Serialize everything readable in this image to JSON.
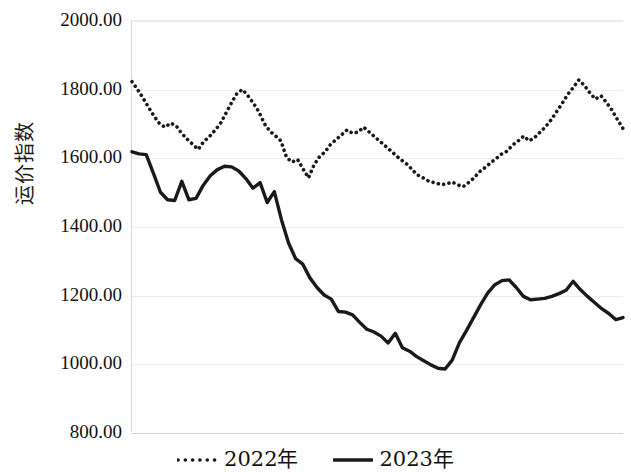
{
  "chart_data": {
    "type": "line",
    "title": "",
    "xlabel": "",
    "ylabel": "运价指数",
    "ylim": [
      800,
      2000
    ],
    "ytick_labels": [
      "2000.00",
      "1800.00",
      "1600.00",
      "1400.00",
      "1200.00",
      "1000.00",
      "800.00"
    ],
    "ytick_values": [
      2000,
      1800,
      1600,
      1400,
      1200,
      1000,
      800
    ],
    "grid": true,
    "xtick_labels": [],
    "legend_position": "bottom-center",
    "series": [
      {
        "name": "2022年",
        "style": "dotted",
        "color": "#1a1a1a",
        "values": [
          1823,
          1800,
          1775,
          1748,
          1722,
          1700,
          1690,
          1702,
          1694,
          1672,
          1655,
          1640,
          1625,
          1648,
          1662,
          1680,
          1700,
          1730,
          1760,
          1788,
          1800,
          1782,
          1760,
          1735,
          1700,
          1678,
          1665,
          1650,
          1602,
          1588,
          1596,
          1568,
          1542,
          1580,
          1604,
          1618,
          1640,
          1654,
          1668,
          1682,
          1672,
          1676,
          1690,
          1676,
          1662,
          1648,
          1634,
          1620,
          1605,
          1592,
          1580,
          1562,
          1548,
          1540,
          1530,
          1528,
          1522,
          1524,
          1530,
          1522,
          1516,
          1528,
          1542,
          1560,
          1572,
          1586,
          1598,
          1612,
          1620,
          1638,
          1650,
          1664,
          1650,
          1660,
          1676,
          1692,
          1712,
          1736,
          1760,
          1786,
          1806,
          1828,
          1812,
          1790,
          1772,
          1782,
          1762,
          1740,
          1712,
          1686
        ]
      },
      {
        "name": "2023年",
        "style": "solid",
        "color": "#1a1a1a",
        "values": [
          1618,
          1612,
          1610,
          1556,
          1500,
          1478,
          1476,
          1532,
          1478,
          1482,
          1520,
          1548,
          1566,
          1576,
          1574,
          1562,
          1540,
          1512,
          1528,
          1470,
          1502,
          1420,
          1352,
          1306,
          1290,
          1250,
          1222,
          1200,
          1188,
          1152,
          1150,
          1142,
          1120,
          1100,
          1092,
          1080,
          1060,
          1088,
          1046,
          1036,
          1020,
          1008,
          996,
          986,
          984,
          1010,
          1060,
          1096,
          1134,
          1172,
          1206,
          1230,
          1242,
          1244,
          1222,
          1196,
          1186,
          1188,
          1190,
          1196,
          1204,
          1214,
          1240,
          1216,
          1196,
          1178,
          1160,
          1146,
          1128,
          1134
        ]
      }
    ]
  },
  "legend": {
    "entries": [
      {
        "label": "2022年",
        "swatch": "dotted-line-swatch"
      },
      {
        "label": "2023年",
        "swatch": "solid-line-swatch"
      }
    ]
  },
  "colors": {
    "line": "#1a1a1a",
    "grid": "#ededed",
    "axis": "#d0d0d0",
    "background": "#ffffff"
  }
}
